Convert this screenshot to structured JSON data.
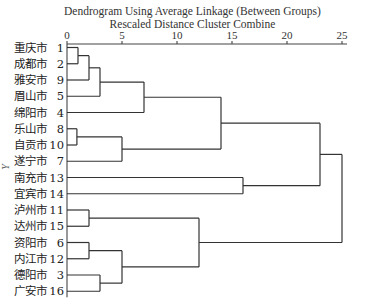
{
  "chart": {
    "title_line1": "Dendrogram Using Average Linkage (Between Groups)",
    "title_line2": "Rescaled Distance Cluster Combine",
    "y_axis_label": "Y"
  },
  "chart_data": {
    "type": "dendrogram",
    "title": "Dendrogram Using Average Linkage (Between Groups)",
    "subtitle": "Rescaled Distance Cluster Combine",
    "xlabel": "Rescaled Distance Cluster Combine",
    "ylabel": "Y",
    "xlim": [
      0,
      25
    ],
    "x_ticks": [
      0,
      5,
      10,
      15,
      20,
      25
    ],
    "leaves": [
      {
        "name": "重庆市",
        "id": 1
      },
      {
        "name": "成都市",
        "id": 2
      },
      {
        "name": "雅安市",
        "id": 9
      },
      {
        "name": "眉山市",
        "id": 5
      },
      {
        "name": "绵阳市",
        "id": 4
      },
      {
        "name": "乐山市",
        "id": 8
      },
      {
        "name": "自贡市",
        "id": 10
      },
      {
        "name": "遂宁市",
        "id": 7
      },
      {
        "name": "南充市",
        "id": 13
      },
      {
        "name": "宜宾市",
        "id": 14
      },
      {
        "name": "泸州市",
        "id": 11
      },
      {
        "name": "达州市",
        "id": 15
      },
      {
        "name": "资阳市",
        "id": 6
      },
      {
        "name": "内江市",
        "id": 12
      },
      {
        "name": "德阳市",
        "id": 3
      },
      {
        "name": "广安市",
        "id": 16
      }
    ],
    "merges": [
      {
        "a": "L0",
        "b": "L1",
        "distance": 1,
        "id": "A"
      },
      {
        "a": "A",
        "b": "L2",
        "distance": 2,
        "id": "B"
      },
      {
        "a": "B",
        "b": "L3",
        "distance": 3,
        "id": "C"
      },
      {
        "a": "C",
        "b": "L4",
        "distance": 7,
        "id": "D"
      },
      {
        "a": "L5",
        "b": "L6",
        "distance": 0.9,
        "id": "E"
      },
      {
        "a": "E",
        "b": "L7",
        "distance": 5,
        "id": "F"
      },
      {
        "a": "D",
        "b": "F",
        "distance": 14,
        "id": "G"
      },
      {
        "a": "L8",
        "b": "L9",
        "distance": 16,
        "id": "H"
      },
      {
        "a": "G",
        "b": "H",
        "distance": 23,
        "id": "I"
      },
      {
        "a": "L10",
        "b": "L11",
        "distance": 2,
        "id": "J"
      },
      {
        "a": "L12",
        "b": "L13",
        "distance": 2,
        "id": "K"
      },
      {
        "a": "L14",
        "b": "L15",
        "distance": 3,
        "id": "M"
      },
      {
        "a": "K",
        "b": "M",
        "distance": 5,
        "id": "N"
      },
      {
        "a": "J",
        "b": "N",
        "distance": 12,
        "id": "O"
      },
      {
        "a": "I",
        "b": "O",
        "distance": 25,
        "id": "P"
      }
    ],
    "grid": false,
    "legend": "none"
  }
}
